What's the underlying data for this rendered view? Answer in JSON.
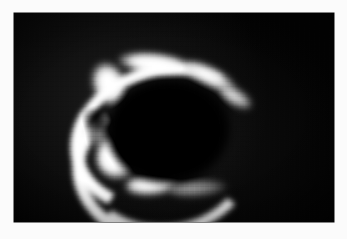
{
  "figure": {
    "kind": "astronomical-grayscale-image",
    "alt_text": "Grayscale astronomical image showing a bright C-shaped ring arc on a black background",
    "background_color": "#fbfbfb",
    "panel_color": "#030303",
    "peak_brightness_color": "#ffffff",
    "mid_brightness_color": "#bdbdbd",
    "faint_brightness_color": "#6b6b6b",
    "panel": {
      "left": 14,
      "top": 13,
      "width": 320,
      "height": 209
    }
  },
  "chart_data": {
    "type": "heatmap",
    "title": "",
    "subtitle": "",
    "xlabel": "",
    "ylabel": "",
    "colormap": "grayscale",
    "grid": false,
    "legend": "none",
    "xlim": [
      0,
      320
    ],
    "ylim": [
      0,
      209
    ],
    "tick_labels_x": [],
    "tick_labels_y": [],
    "annotations": [],
    "features": [
      {
        "name": "upper-left-elbow",
        "label": "Brightest knot of the arc (upper-left corner of the C)",
        "x": 95,
        "y": 71,
        "intensity": 1.0,
        "intensity_label": "peak"
      },
      {
        "name": "top-bar",
        "label": "Upper sweep running left to right across the top",
        "x": 142,
        "y": 51,
        "intensity": 0.95,
        "intensity_label": "very bright"
      },
      {
        "name": "upper-right-taper",
        "label": "Upper arm thinning toward the right",
        "x": 196,
        "y": 64,
        "intensity": 0.74,
        "intensity_label": "bright"
      },
      {
        "name": "upper-right-tip",
        "label": "Faint terminus of the upper arm",
        "x": 222,
        "y": 85,
        "intensity": 0.5,
        "intensity_label": "moderate"
      },
      {
        "name": "left-gap",
        "label": "Dark break interrupting the left limb",
        "x": 83,
        "y": 106,
        "intensity": 0.22,
        "intensity_label": "dim gap"
      },
      {
        "name": "lower-left-limb",
        "label": "Bright lower-left segment of the arc",
        "x": 105,
        "y": 144,
        "intensity": 0.97,
        "intensity_label": "very bright"
      },
      {
        "name": "bottom-sweep",
        "label": "Lower sweep curving to the right",
        "x": 139,
        "y": 171,
        "intensity": 0.78,
        "intensity_label": "bright"
      },
      {
        "name": "lower-right-tail",
        "label": "Faint diffuse tail at the lower right",
        "x": 184,
        "y": 175,
        "intensity": 0.42,
        "intensity_label": "faint"
      },
      {
        "name": "interior-void",
        "label": "Dark interior enclosed by the C-shaped arc",
        "x": 155,
        "y": 118,
        "intensity": 0.02,
        "intensity_label": "background"
      }
    ],
    "intensity_scale": {
      "min": 0.0,
      "max": 1.0,
      "min_label": "black / sky background",
      "max_label": "white / saturated"
    }
  }
}
